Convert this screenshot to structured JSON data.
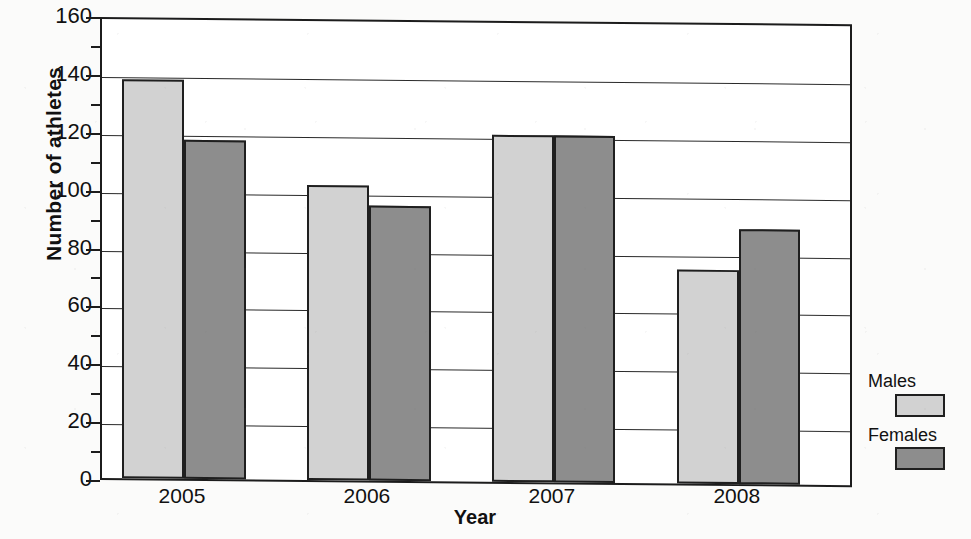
{
  "chart_data": {
    "type": "bar",
    "title": "",
    "subtitle": "",
    "xlabel": "Year",
    "ylabel": "Number of athletes",
    "categories": [
      "2005",
      "2006",
      "2007",
      "2008"
    ],
    "series": [
      {
        "name": "Males",
        "color": "#d2d2d2",
        "values": [
          138,
          102,
          120,
          74
        ]
      },
      {
        "name": "Females",
        "color": "#8d8d8d",
        "values": [
          117,
          95,
          120,
          88
        ]
      }
    ],
    "ylim": [
      0,
      160
    ],
    "ytick_values": [
      0,
      20,
      40,
      60,
      80,
      100,
      120,
      140,
      160
    ],
    "ytick_labels": [
      "0",
      "20",
      "40",
      "60",
      "80",
      "100",
      "120",
      "140",
      "160"
    ],
    "yminor_step": 10,
    "grid": "horizontal",
    "legend_position": "right",
    "legend_entries": [
      "Males",
      "Females"
    ],
    "bar_gap": "none",
    "frame": "box",
    "colors": {
      "male_fill": "#d2d2d2",
      "female_fill": "#8d8d8d",
      "outline": "#1f1f1f",
      "text": "#111111",
      "background": "#ffffff"
    }
  }
}
